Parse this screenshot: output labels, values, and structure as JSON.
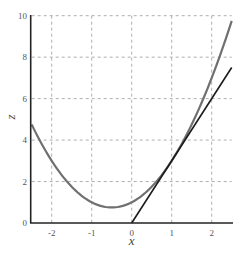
{
  "chart_data": {
    "type": "line",
    "title": "",
    "xlabel": "x",
    "ylabel": "z",
    "xlim": [
      -2.5,
      2.5
    ],
    "ylim": [
      0,
      10
    ],
    "grid": true,
    "grid_style": "dashed",
    "x_ticks": [
      -2,
      -1,
      0,
      1,
      2
    ],
    "y_ticks": [
      0,
      2,
      4,
      6,
      8,
      10
    ],
    "series": [
      {
        "name": "curve",
        "formula": "x^2 + x + 1",
        "color": "#707070",
        "x": [
          -2.5,
          -2,
          -1.5,
          -1,
          -0.5,
          0,
          0.5,
          1,
          1.5,
          2,
          2.5
        ],
        "values": [
          4.75,
          3,
          1.75,
          1,
          0.75,
          1,
          1.75,
          3,
          4.75,
          7,
          9.75
        ]
      },
      {
        "name": "tangent line at x=1",
        "formula": "3x",
        "color": "#1a1a1a",
        "x": [
          0,
          2.5
        ],
        "values": [
          0,
          7.5
        ]
      }
    ]
  },
  "axes": {
    "x_label": "x",
    "y_label": "z",
    "x_tick_labels": [
      "-2",
      "-1",
      "0",
      "1",
      "2"
    ],
    "y_tick_labels": [
      "0",
      "2",
      "4",
      "6",
      "8",
      "10"
    ]
  }
}
